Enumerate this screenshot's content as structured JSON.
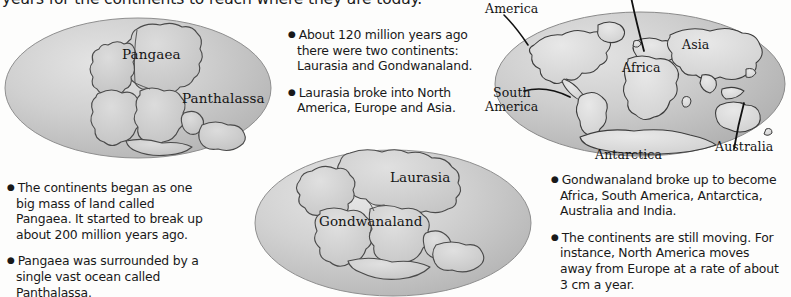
{
  "page": {
    "heading": "years for the continents to reach where they are today.",
    "background_color": "#fdfdfc",
    "text_color": "#141414"
  },
  "globes": [
    {
      "id": "pangaea-globe",
      "name": "globe-pangaea",
      "ocean_color": "#c9c9c9",
      "land_color": "#cfcfcf",
      "outline_color": "#3a3a3a",
      "labels": [
        {
          "name": "label-pangaea",
          "text": "Pangaea"
        },
        {
          "name": "label-panthalassa",
          "text": "Panthalassa"
        }
      ]
    },
    {
      "id": "laurasia-globe",
      "name": "globe-laurasia-gondwanaland",
      "ocean_color": "#c9c9c9",
      "land_color": "#d2d2d2",
      "outline_color": "#3a3a3a",
      "labels": [
        {
          "name": "label-laurasia",
          "text": "Laurasia"
        },
        {
          "name": "label-gondwanaland",
          "text": "Gondwanaland"
        }
      ]
    },
    {
      "id": "modern-globe",
      "name": "globe-modern-continents",
      "ocean_color": "#c7c7c7",
      "land_color": "#d8d8d8",
      "outline_color": "#333333",
      "labels": [
        {
          "name": "label-north-america",
          "text": "America"
        },
        {
          "name": "label-asia",
          "text": "Asia"
        },
        {
          "name": "label-africa",
          "text": "Africa"
        },
        {
          "name": "label-south-america-line1",
          "text": "South"
        },
        {
          "name": "label-south-america-line2",
          "text": "America"
        },
        {
          "name": "label-antarctica",
          "text": "Antarctica"
        },
        {
          "name": "label-australia",
          "text": "Australia"
        }
      ]
    }
  ],
  "text_blocks": {
    "center_top": {
      "bullet": "●",
      "paragraphs": [
        "About 120 million years ago there were two continents: Laurasia and Gondwanaland.",
        "Laurasia broke into North America, Europe and Asia."
      ]
    },
    "bottom_left": {
      "bullet": "●",
      "paragraphs": [
        "The continents began as one big mass of land called Pangaea. It started to break up about 200 million years ago.",
        "Pangaea was surrounded by a single vast ocean called Panthalassa."
      ]
    },
    "bottom_right": {
      "bullet": "●",
      "paragraphs": [
        "Gondwanaland broke up to become Africa, South America, Antarctica, Australia and India.",
        "The continents are still moving. For instance, North America moves away from Europe at a rate of about 3 cm a year."
      ]
    }
  }
}
